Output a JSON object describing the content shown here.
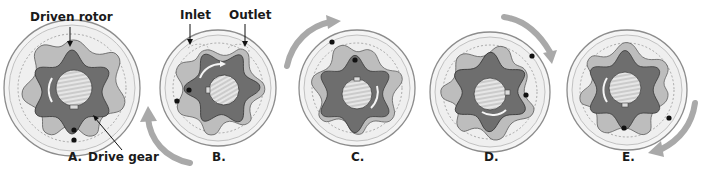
{
  "figure": {
    "colors": {
      "housing_fill": "#f2f2f2",
      "housing_stroke": "#9a9a9a",
      "outer_rotor_fill": "#b9b9b9",
      "inner_gear_fill": "#707070",
      "shaft_fill": "#d9d9d9",
      "arrow": "#a6a6a6",
      "dot": "#111111"
    },
    "callouts": {
      "driven_rotor": "Driven rotor",
      "inlet": "Inlet",
      "outlet": "Outlet",
      "drive_gear": "Drive gear"
    },
    "stages": [
      {
        "id": "A",
        "label": "A."
      },
      {
        "id": "B",
        "label": "B."
      },
      {
        "id": "C",
        "label": "C."
      },
      {
        "id": "D",
        "label": "D."
      },
      {
        "id": "E",
        "label": "E."
      }
    ]
  }
}
